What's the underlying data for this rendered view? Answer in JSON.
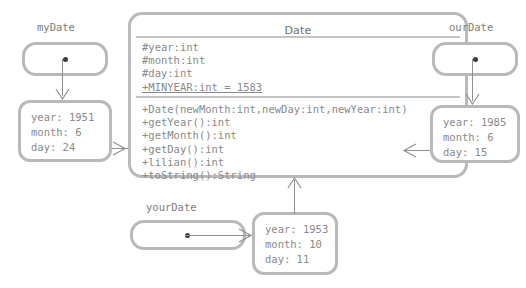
{
  "diagram": {
    "kind": "uml-object-class-diagram",
    "background_color": "#ffffff",
    "line_color": "#909090",
    "box_border_color": "#b9b9b9",
    "text_color": "#8a8a8a"
  },
  "date_class": {
    "title": "Date",
    "attributes": [
      {
        "text": "#year:int",
        "static": false
      },
      {
        "text": "#month:int",
        "static": false
      },
      {
        "text": "#day:int",
        "static": false
      },
      {
        "text": "+MINYEAR:int = 1583",
        "static": true
      }
    ],
    "methods": [
      {
        "text": "+Date(newMonth:int,newDay:int,newYear:int)"
      },
      {
        "text": "+getYear():int"
      },
      {
        "text": "+getMonth():int"
      },
      {
        "text": "+getDay():int"
      },
      {
        "text": "+lilian():int"
      },
      {
        "text": "+toString():String"
      }
    ]
  },
  "objects": [
    {
      "id": "myDate",
      "label": "myDate",
      "attributes": [
        "year: 1951",
        "month: 6",
        "day: 24"
      ]
    },
    {
      "id": "ourDate",
      "label": "ourDate",
      "attributes": [
        "year: 1985",
        "month: 6",
        "day: 15"
      ]
    },
    {
      "id": "yourDate",
      "label": "yourDate",
      "attributes": [
        "year: 1953",
        "month: 10",
        "day: 11"
      ]
    }
  ]
}
